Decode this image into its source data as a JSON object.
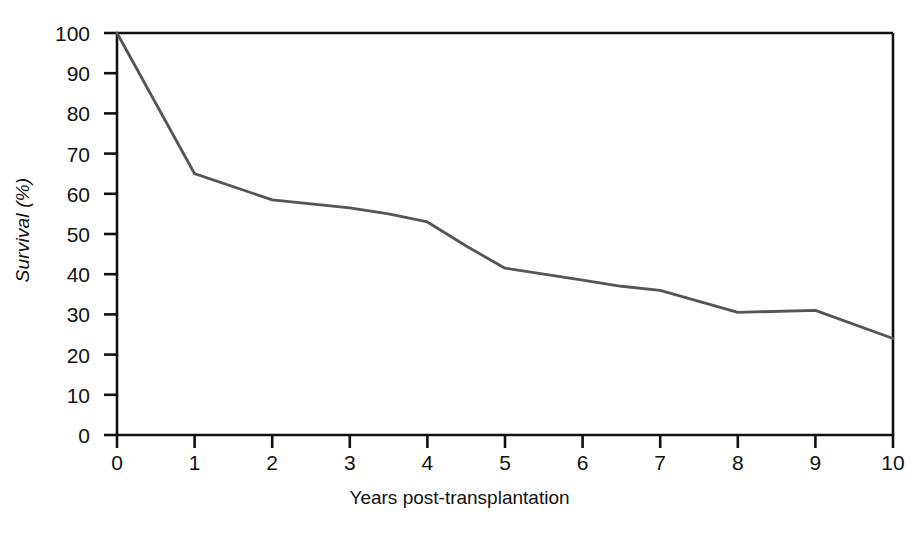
{
  "chart_data": {
    "type": "line",
    "title": "",
    "xlabel": "Years post-transplantation",
    "ylabel": "Survival (%)",
    "xlim": [
      0,
      10
    ],
    "ylim": [
      0,
      100
    ],
    "grid": false,
    "legend": null,
    "x_ticks": [
      "0",
      "1",
      "2",
      "3",
      "4",
      "5",
      "6",
      "7",
      "8",
      "9",
      "10"
    ],
    "y_ticks": [
      "0",
      "10",
      "20",
      "30",
      "40",
      "50",
      "60",
      "70",
      "80",
      "90",
      "100"
    ],
    "series": [
      {
        "name": "Survival",
        "color": "#555555",
        "x": [
          0,
          1,
          2,
          2.5,
          3,
          3.5,
          4,
          4.5,
          5,
          5.5,
          6,
          6.5,
          7,
          8,
          9,
          10
        ],
        "values": [
          100,
          65,
          58.5,
          57.5,
          56.5,
          55,
          53,
          47,
          41.5,
          40,
          38.5,
          37,
          36,
          30.5,
          31,
          24
        ]
      }
    ],
    "annotations": []
  },
  "axes": {
    "line_color": "#111111",
    "frame": [
      "top",
      "left",
      "right",
      "bottom"
    ]
  }
}
